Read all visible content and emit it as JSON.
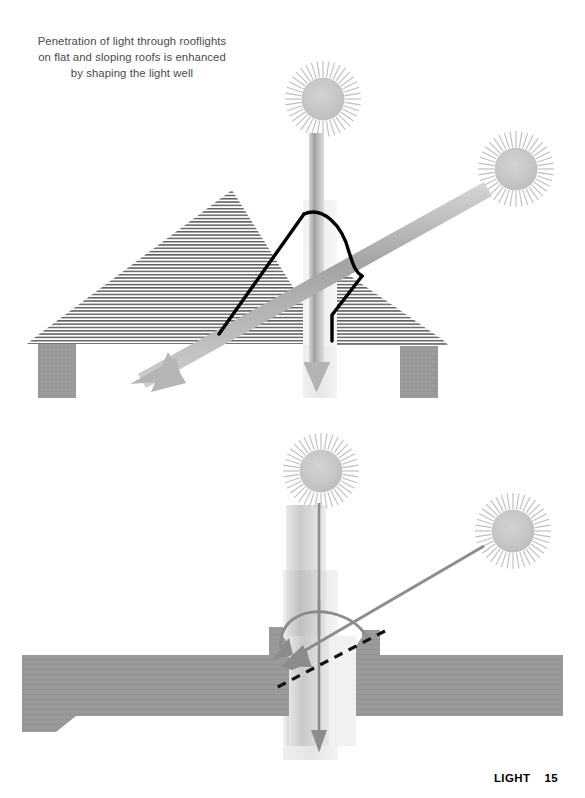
{
  "page": {
    "width": 585,
    "height": 798,
    "background": "#ffffff"
  },
  "caption": {
    "line1": "Penetration of light through rooflights",
    "line2": "on flat and sloping roofs is enhanced",
    "line3": "by shaping the light well"
  },
  "footer": {
    "section": "LIGHT",
    "page_number": "15"
  },
  "colors": {
    "sun_disc": "#c9c9c9",
    "sun_rays": "#c0c0c0",
    "beam_gray": "#b0b0b0",
    "beam_gray_dark": "#9a9a9a",
    "masonry_gray": "#9d9d9d",
    "hatch_line": "#6e6e6e",
    "outline_black": "#000000",
    "caption_text": "#4a4a4a",
    "footer_text": "#000000",
    "arrow_gray": "#8c8c8c"
  },
  "diagrams": [
    {
      "id": "sloping-roof",
      "title": "Sloping roof rooflight with shaped light well",
      "elements": {
        "sun_overhead": {
          "cx": 323,
          "cy": 99,
          "r": 20,
          "rays": 40,
          "label": "overhead-sun"
        },
        "sun_low_right": {
          "cx": 516,
          "cy": 169,
          "r": 20,
          "rays": 40,
          "label": "low-angle-sun"
        },
        "vertical_beam": {
          "x": 316,
          "y_top": 130,
          "y_bottom": 392,
          "width": 14
        },
        "diagonal_beam": {
          "x1": 483,
          "y1": 188,
          "x2": 135,
          "y2": 380,
          "width": 15
        },
        "roof_pitch_left": "hatched sloping roof, left slope",
        "roof_pitch_right": "hatched sloping roof, right slope",
        "pier_left": {
          "x": 38,
          "y": 337,
          "w": 38,
          "h": 60
        },
        "pier_right": {
          "x": 400,
          "y": 340,
          "w": 38,
          "h": 58
        },
        "light_well": "black outline of curved/splayed light well through roof void"
      }
    },
    {
      "id": "flat-roof",
      "title": "Flat roof rooflight with splayed light well",
      "elements": {
        "sun_overhead": {
          "cx": 321,
          "cy": 471,
          "r": 20,
          "rays": 40,
          "label": "overhead-sun"
        },
        "sun_low_right": {
          "cx": 513,
          "cy": 531,
          "r": 20,
          "rays": 40,
          "label": "low-angle-sun"
        },
        "vertical_beam": {
          "x": 319,
          "y_top": 503,
          "y_bottom": 752,
          "width": 14
        },
        "diagonal_ray": {
          "x1": 482,
          "y1": 548,
          "x2": 281,
          "y2": 666,
          "width": 3
        },
        "curved_reflect_arrow": "gray arc from right upstand curving left and down into well",
        "dashed_sightline": {
          "x1": 382,
          "y1": 633,
          "x2": 277,
          "y2": 688
        },
        "slab_left": "flat roof slab extending to left edge with splayed soffit",
        "slab_right": "flat roof slab extending to right edge with splayed soffit",
        "upstand_left": "kerb upstand left of opening",
        "upstand_right": "kerb upstand right of opening"
      }
    }
  ]
}
